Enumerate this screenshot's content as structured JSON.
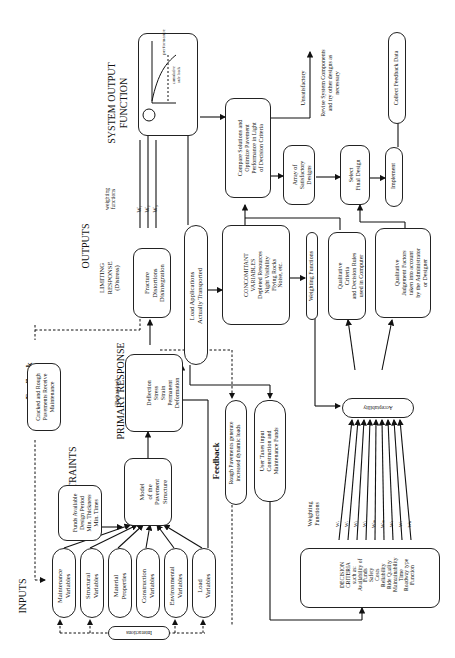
{
  "diagram": {
    "orientation": "rotated 90 degrees counter-clockwise",
    "section_headings": {
      "inputs": "INPUTS",
      "constraints": "CONSTRAINTS",
      "primary_response": "PRIMARY RESPONSE",
      "primary_response_sub": "(Behavior)",
      "outputs": "OUTPUTS",
      "limiting_response": "LIMITING\nRESPONSE\n(Distress)",
      "system_output": "SYSTEM OUTPUT\nFUNCTION",
      "feedback_top": "Feedback",
      "feedback_mid": "Feedback"
    },
    "inputs": [
      {
        "label": "Maintenance\nVariables"
      },
      {
        "label": "Structural\nVariables"
      },
      {
        "label": "Material\nProperties"
      },
      {
        "label": "Construction\nVariables"
      },
      {
        "label": "Environmental\nVariables"
      },
      {
        "label": "Load\nVariables"
      }
    ],
    "interactions": "Interactions",
    "constraints_box": "Funds Available\nDesign Period\nMin. Thickness\nMin. Times",
    "model_box": "Model\nof the\nPavement\nStructure",
    "primary_box": "Deflection\nStress\nStrain\nPermanent\nDeformation",
    "feedback_cracked": "Cracked and Rough\nPavements Receive\nMaintenance",
    "limiting_box": "Fracture\nDistortions\nDisintegration",
    "weighting_functions_label": "weighting\nfunctions",
    "weights_out": [
      "W₁",
      "W₂",
      "W₃"
    ],
    "load_applications": "Load Applications\nActually Transported",
    "feedback_rough": "Rough Pavements generate\nincreased dynamic loads",
    "user_taxes": "User Taxes input\nConstruction and\nMaintenance Funds",
    "concomitant": "CONCOMITANT\nVARIABLES\nDepleted Resources\nNight Visibility\nFlying Rocks\nNoise, etc.",
    "weighting_functions_box": "Weighting Functions",
    "qualitative_criteria": "Qualitative\nCriteria\nand Decision Rules\nused in Computer",
    "qualitative_judgement": "Qualitative\nJudgement Factors\ntaken into account\nby the Administrator\nor Designer",
    "system_output_graph": {
      "y_label": "performance",
      "x_label": "cumulative\naxle loads",
      "node_label": "Perf.",
      "output": "E"
    },
    "compare_box": "Compare Solutions and\nOptimize Pavement\nPerformance in Light\nof Decision Criteria",
    "unsatisfactory": "Unsatisfactory",
    "revise": "Revise System Components\nand try other designs as\nnecessary",
    "array_box": "Array of\nSatisfactory\nDesigns",
    "select_box": "Select\nFinal Design",
    "implement_box": "Implement",
    "collect_box": "Collect Feedback Data",
    "acceptability": "Acceptability",
    "decision_criteria": "DECISION\nCRITERIA\nsuch as:\nAvailability of\nFunds\nSafety\nCosts\nReliability\nRide Quality\nMaintainability\nTime\nRoadway type\nFunction",
    "weighting_functions_dc": "Weighting\nFunctions",
    "weights_dc": [
      "Wₐ",
      "Wᵣ",
      "Wⱼ",
      "Wⱼ",
      "Wₘ",
      "Wₘ",
      "Wₜ",
      "Wᵣ",
      "Wₕ"
    ]
  }
}
